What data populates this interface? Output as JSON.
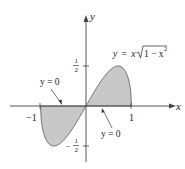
{
  "figure": {
    "title": "",
    "curve_label": "y = x√(1 − x²)",
    "curve_label_parts": {
      "y": "y",
      "eq": "=",
      "x": "x",
      "root_content": "1 − x",
      "exp": "2"
    },
    "axis_x_label": "x",
    "axis_y_label": "y",
    "ticks": {
      "x": [
        {
          "value": -1,
          "label": "−1"
        },
        {
          "value": 1,
          "label": "1"
        }
      ],
      "y": [
        {
          "value": 0.5,
          "label_num": "1",
          "label_den": "2",
          "sign": ""
        },
        {
          "value": -0.5,
          "label_num": "1",
          "label_den": "2",
          "sign": "−"
        }
      ]
    },
    "annotations": [
      {
        "text": "y = 0",
        "position": "upper-left",
        "points_to": "x-axis segment left of origin"
      },
      {
        "text": "y = 0",
        "position": "lower-right",
        "points_to": "x-axis segment right of origin"
      }
    ],
    "shaded_regions": [
      {
        "between": "curve and y = 0",
        "x_range": [
          -1,
          0
        ],
        "color": "#c8c8c8"
      },
      {
        "between": "curve and y = 0",
        "x_range": [
          0,
          1
        ],
        "color": "#c8c8c8"
      }
    ],
    "colors": {
      "axis": "#444444",
      "curve": "#555555",
      "fill": "#c8c8c8",
      "text": "#222222"
    }
  }
}
